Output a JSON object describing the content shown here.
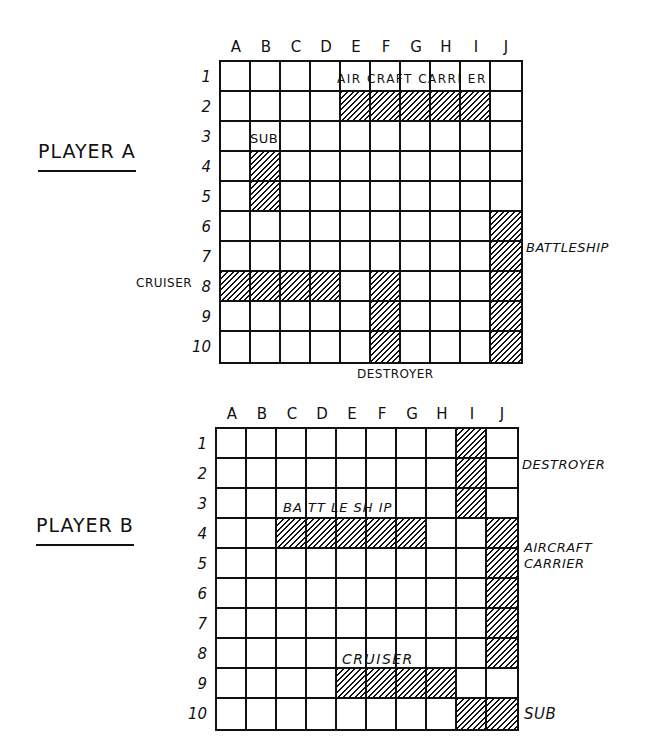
{
  "columns": [
    "A",
    "B",
    "C",
    "D",
    "E",
    "F",
    "G",
    "H",
    "I",
    "J"
  ],
  "rows": [
    "1",
    "2",
    "3",
    "4",
    "5",
    "6",
    "7",
    "8",
    "9",
    "10"
  ],
  "colors": {
    "ink": "#111111",
    "background": "#ffffff"
  },
  "boards": [
    {
      "title": "PLAYER A",
      "ships": [
        {
          "name": "AIRCRAFT CARRIER",
          "label": "AIR CRAFT CARRI ER",
          "cells": [
            "E2",
            "F2",
            "G2",
            "H2",
            "I2"
          ]
        },
        {
          "name": "SUB",
          "label": "SUB",
          "cells": [
            "B4",
            "B5"
          ]
        },
        {
          "name": "BATTLESHIP",
          "label": "BATTLESHIP",
          "cells": [
            "J6",
            "J7",
            "J8",
            "J9",
            "J10"
          ]
        },
        {
          "name": "CRUISER",
          "label": "CRUISER",
          "cells": [
            "A8",
            "B8",
            "C8",
            "D8"
          ]
        },
        {
          "name": "DESTROYER",
          "label": "DESTROYER",
          "cells": [
            "F8",
            "F9",
            "F10"
          ]
        }
      ]
    },
    {
      "title": "PLAYER B",
      "ships": [
        {
          "name": "DESTROYER",
          "label": "DESTROYER",
          "cells": [
            "I1",
            "I2",
            "I3"
          ]
        },
        {
          "name": "BATTLESHIP",
          "label": "BA TT LE SH IP",
          "cells": [
            "C4",
            "D4",
            "E4",
            "F4",
            "G4"
          ]
        },
        {
          "name": "AIRCRAFT CARRIER",
          "label": "AIRCRAFT CARRIER",
          "label_line1": "AIRCRAFT",
          "label_line2": "CARRIER",
          "cells": [
            "J4",
            "J5",
            "J6",
            "J7",
            "J8"
          ]
        },
        {
          "name": "CRUISER",
          "label": "CRUISER",
          "cells": [
            "E9",
            "F9",
            "G9",
            "H9"
          ]
        },
        {
          "name": "SUB",
          "label": "SUB",
          "cells": [
            "I10",
            "J10"
          ]
        }
      ]
    }
  ]
}
